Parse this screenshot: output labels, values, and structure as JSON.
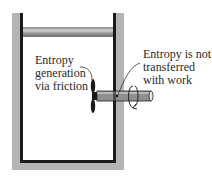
{
  "figure": {
    "type": "piston-cylinder device with paddle wheel and rotating shaft",
    "labels": {
      "left": {
        "line1": "Entropy",
        "line2": "generation",
        "line3": "via friction"
      },
      "right": {
        "line1": "Entropy is not",
        "line2": "transferred",
        "line3": "with work"
      }
    },
    "colors": {
      "wall_outer": "#b4b4b4",
      "wall_inner": "#1a1a1a",
      "shaft": "#8f8f8f",
      "text": "#2a2a2a"
    }
  }
}
